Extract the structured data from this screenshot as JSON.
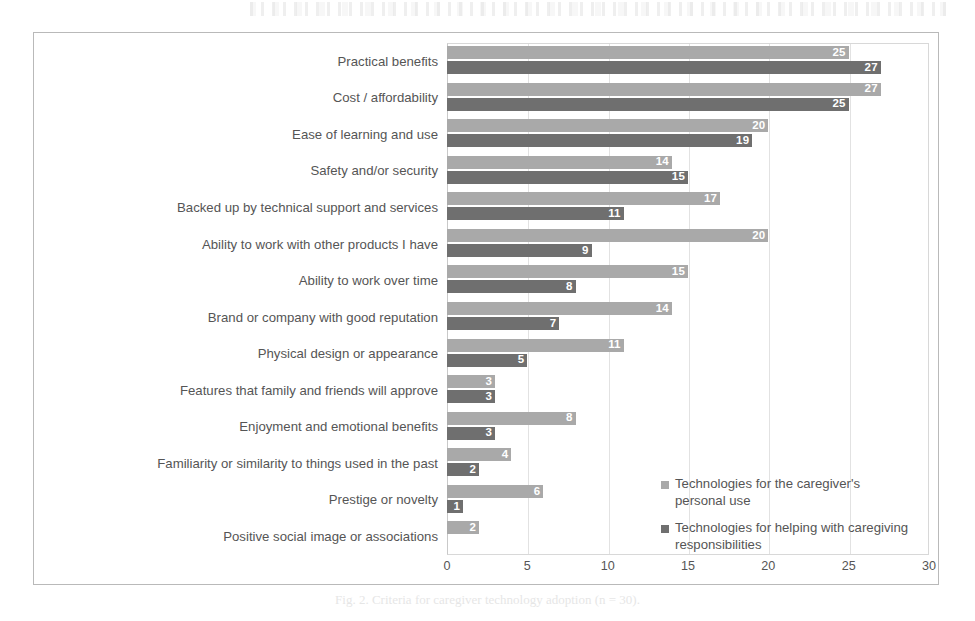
{
  "figure": {
    "caption": "Fig. 2. Criteria for caregiver technology adoption (n = 30)."
  },
  "legend": {
    "position": "inside-bottom-right",
    "items": [
      {
        "label": "Technologies for the caregiver's personal use",
        "color": "#a9a9a9",
        "swatch_name": "legend-swatch-personal-use"
      },
      {
        "label": "Technologies for helping with caregiving responsibilities",
        "color": "#6f6f6f",
        "swatch_name": "legend-swatch-caregiving"
      }
    ]
  },
  "chart_data": {
    "type": "bar",
    "orientation": "horizontal",
    "title": "",
    "subtitle": "",
    "xlabel": "",
    "ylabel": "",
    "xlim": [
      0,
      30
    ],
    "xticks": [
      0,
      5,
      10,
      15,
      20,
      25,
      30
    ],
    "grid": true,
    "grid_axis": "x",
    "bar_value_labels": true,
    "categories": [
      "Practical benefits",
      "Cost / affordability",
      "Ease of learning and use",
      "Safety and/or security",
      "Backed up by technical support and services",
      "Ability to work with other products I have",
      "Ability to work over time",
      "Brand or company with good reputation",
      "Physical design or appearance",
      "Features that family and friends will approve",
      "Enjoyment and emotional benefits",
      "Familiarity or similarity to things used in the past",
      "Prestige or novelty",
      "Positive social image or associations"
    ],
    "series": [
      {
        "name": "Technologies for the caregiver's personal use",
        "color": "#a9a9a9",
        "values": [
          25,
          27,
          20,
          14,
          17,
          20,
          15,
          14,
          11,
          3,
          8,
          4,
          6,
          2
        ]
      },
      {
        "name": "Technologies for helping with caregiving responsibilities",
        "color": "#6f6f6f",
        "values": [
          27,
          25,
          19,
          15,
          11,
          9,
          8,
          7,
          5,
          3,
          3,
          2,
          1,
          null
        ]
      }
    ]
  }
}
